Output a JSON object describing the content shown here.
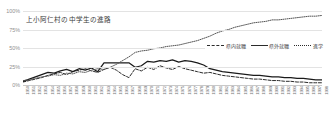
{
  "chart_data": {
    "type": "line",
    "title": "上小阿仁村の中学生の進路",
    "xlabel": "",
    "ylabel": "",
    "ylim": [
      0,
      100
    ],
    "yticks": [
      "0%",
      "25%",
      "50%",
      "75%",
      "100%"
    ],
    "ytick_values": [
      0,
      25,
      50,
      75,
      100
    ],
    "grid": true,
    "legend_position": "middle-right",
    "x": [
      "1950",
      "1951",
      "1952",
      "1953",
      "1954",
      "1955",
      "1956",
      "1957",
      "1958",
      "1959",
      "1960",
      "1961",
      "1962",
      "1963",
      "1964",
      "1965",
      "1966",
      "1967",
      "1968",
      "1969",
      "1970",
      "1971",
      "1972",
      "1973",
      "1974",
      "1975",
      "1976",
      "1977",
      "1978",
      "1979",
      "1980",
      "1981",
      "1982",
      "1983",
      "1984",
      "1985",
      "1986",
      "1987",
      "1988",
      "1989",
      "1990",
      "1991",
      "1992",
      "1993",
      "1994",
      "1995",
      "1996",
      "1997",
      "1998"
    ],
    "series": [
      {
        "name": "県内就職",
        "style": "dashed",
        "color": "#2b2b2b",
        "values": [
          4,
          6,
          8,
          10,
          13,
          15,
          17,
          14,
          18,
          20,
          22,
          19,
          17,
          21,
          24,
          20,
          14,
          10,
          22,
          19,
          24,
          21,
          26,
          23,
          21,
          25,
          22,
          20,
          18,
          16,
          17,
          15,
          13,
          12,
          11,
          10,
          9,
          8,
          8,
          7,
          6,
          6,
          5,
          5,
          4,
          4,
          3,
          3,
          3
        ]
      },
      {
        "name": "県外就職",
        "style": "solid",
        "color": "#1a1a1a",
        "values": [
          5,
          8,
          11,
          14,
          17,
          16,
          19,
          21,
          18,
          22,
          20,
          23,
          18,
          30,
          30,
          30,
          30,
          30,
          24,
          26,
          32,
          31,
          33,
          32,
          34,
          31,
          33,
          32,
          30,
          27,
          22,
          20,
          18,
          17,
          16,
          15,
          14,
          13,
          13,
          12,
          11,
          11,
          10,
          10,
          9,
          9,
          8,
          7,
          7
        ]
      },
      {
        "name": "進学",
        "style": "dotted",
        "color": "#555555",
        "values": [
          6,
          7,
          9,
          11,
          12,
          14,
          13,
          16,
          15,
          18,
          17,
          20,
          22,
          21,
          24,
          28,
          33,
          38,
          44,
          46,
          47,
          49,
          50,
          52,
          53,
          54,
          56,
          58,
          60,
          63,
          66,
          70,
          73,
          75,
          78,
          80,
          82,
          84,
          85,
          86,
          88,
          88,
          89,
          90,
          91,
          92,
          93,
          93,
          94
        ]
      }
    ]
  },
  "legend": {
    "items": [
      {
        "label": "県内就職",
        "style": "dashed"
      },
      {
        "label": "県外就職",
        "style": "solid"
      },
      {
        "label": "進学",
        "style": "dotted"
      }
    ]
  }
}
